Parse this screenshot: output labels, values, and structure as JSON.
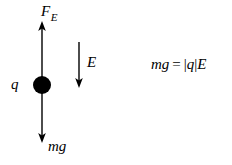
{
  "figure": {
    "background_color": "#ffffff",
    "stroke_color": "#000000"
  },
  "charge": {
    "label": "q",
    "center_x": 42,
    "center_y": 85,
    "radius": 9,
    "fill_color": "#000000"
  },
  "vectors": {
    "electric_force": {
      "label": "F",
      "subscript": "E",
      "direction": "up",
      "tail_x": 42,
      "tail_y": 85,
      "tip_x": 42,
      "tip_y": 22
    },
    "weight": {
      "label": "mg",
      "direction": "down",
      "tail_x": 42,
      "tail_y": 85,
      "tip_x": 42,
      "tip_y": 143
    },
    "field": {
      "label": "E",
      "direction": "down",
      "tail_x": 79,
      "tail_y": 42,
      "tip_x": 79,
      "tip_y": 88
    }
  },
  "equation": {
    "full_text": "mg = |q|E",
    "left_side": "mg",
    "operator": "=",
    "right_side": "|q|E",
    "abs_open": "|",
    "abs_charge": "q",
    "abs_close": "|",
    "field_symbol": "E"
  }
}
